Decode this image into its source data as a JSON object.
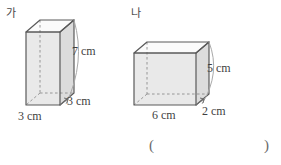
{
  "figure": {
    "type": "geometry-diagram",
    "background_color": "#ffffff",
    "line_color": "#555555",
    "face_front_color": "#e9e9e9",
    "face_side_color": "#dddddd",
    "face_top_color": "#fbfbfb",
    "hidden_edge_style": "dashed",
    "solids": [
      {
        "name": "ga",
        "label": "가",
        "shape": "rectangular prism",
        "dimensions": {
          "width": "3 cm",
          "depth": "3 cm",
          "height": "7 cm"
        },
        "labels": {
          "height": "7 cm",
          "depth": "3 cm",
          "width": "3 cm"
        }
      },
      {
        "name": "na",
        "label": "나",
        "shape": "rectangular prism",
        "dimensions": {
          "width": "6 cm",
          "depth": "2 cm",
          "height": "5 cm"
        },
        "labels": {
          "height": "5 cm",
          "depth": "2 cm",
          "width": "6 cm"
        }
      }
    ]
  },
  "answer": {
    "open_paren": "(",
    "close_paren": ")",
    "value": ""
  }
}
